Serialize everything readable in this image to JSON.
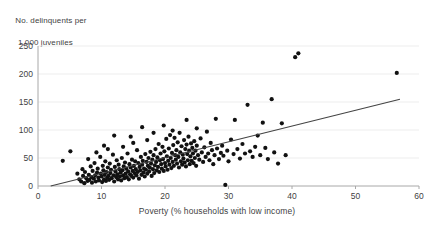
{
  "chart_data": {
    "type": "scatter",
    "title": "",
    "ylabel_line1": "No. delinquents per",
    "ylabel_line2": "1,000 juveniles",
    "xlabel": "Poverty (% households with low income)",
    "xlim": [
      0,
      60
    ],
    "ylim": [
      0,
      250
    ],
    "xticks": [
      0,
      10,
      20,
      30,
      40,
      50,
      60
    ],
    "yticks": [
      0,
      50,
      100,
      150,
      200,
      250
    ],
    "grid": "horizontal",
    "legend": "none",
    "point_color": "#111111",
    "point_radius": 2.1,
    "line_color": "#444444",
    "trendline": {
      "type": "linear",
      "x_start": 2.0,
      "y_start": 0,
      "x_end": 57.0,
      "y_end": 155
    },
    "points": [
      [
        3.9,
        45
      ],
      [
        5.1,
        62
      ],
      [
        6.2,
        22
      ],
      [
        6.5,
        12
      ],
      [
        6.8,
        8
      ],
      [
        7.0,
        30
      ],
      [
        7.1,
        18
      ],
      [
        7.3,
        5
      ],
      [
        7.4,
        25
      ],
      [
        7.6,
        14
      ],
      [
        7.8,
        9
      ],
      [
        7.9,
        48
      ],
      [
        8.0,
        20
      ],
      [
        8.1,
        11
      ],
      [
        8.3,
        35
      ],
      [
        8.4,
        16
      ],
      [
        8.5,
        6
      ],
      [
        8.6,
        27
      ],
      [
        8.8,
        13
      ],
      [
        8.9,
        41
      ],
      [
        9.0,
        19
      ],
      [
        9.1,
        8
      ],
      [
        9.3,
        24
      ],
      [
        9.4,
        31
      ],
      [
        9.5,
        15
      ],
      [
        9.6,
        10
      ],
      [
        9.8,
        52
      ],
      [
        9.9,
        22
      ],
      [
        10.0,
        17
      ],
      [
        10.1,
        7
      ],
      [
        10.2,
        36
      ],
      [
        10.3,
        28
      ],
      [
        10.4,
        12
      ],
      [
        10.5,
        20
      ],
      [
        10.6,
        44
      ],
      [
        10.7,
        9
      ],
      [
        10.8,
        25
      ],
      [
        10.9,
        15
      ],
      [
        11.0,
        33
      ],
      [
        11.1,
        18
      ],
      [
        11.2,
        11
      ],
      [
        11.3,
        40
      ],
      [
        11.4,
        23
      ],
      [
        11.5,
        29
      ],
      [
        11.6,
        14
      ],
      [
        11.8,
        56
      ],
      [
        11.9,
        19
      ],
      [
        12.0,
        8
      ],
      [
        12.1,
        34
      ],
      [
        12.2,
        26
      ],
      [
        12.3,
        16
      ],
      [
        12.4,
        46
      ],
      [
        12.5,
        21
      ],
      [
        12.6,
        12
      ],
      [
        12.7,
        38
      ],
      [
        12.8,
        30
      ],
      [
        12.9,
        17
      ],
      [
        13.0,
        24
      ],
      [
        13.1,
        10
      ],
      [
        13.2,
        50
      ],
      [
        13.3,
        28
      ],
      [
        13.4,
        19
      ],
      [
        13.5,
        35
      ],
      [
        13.6,
        14
      ],
      [
        13.7,
        42
      ],
      [
        13.8,
        22
      ],
      [
        13.9,
        31
      ],
      [
        14.0,
        16
      ],
      [
        14.1,
        58
      ],
      [
        14.2,
        26
      ],
      [
        14.3,
        12
      ],
      [
        14.4,
        39
      ],
      [
        14.5,
        21
      ],
      [
        14.6,
        33
      ],
      [
        14.7,
        18
      ],
      [
        14.8,
        47
      ],
      [
        14.9,
        27
      ],
      [
        15.0,
        15
      ],
      [
        15.1,
        36
      ],
      [
        15.2,
        23
      ],
      [
        15.3,
        44
      ],
      [
        15.4,
        30
      ],
      [
        15.5,
        19
      ],
      [
        15.6,
        64
      ],
      [
        15.7,
        25
      ],
      [
        15.8,
        41
      ],
      [
        15.9,
        13
      ],
      [
        16.0,
        34
      ],
      [
        16.1,
        28
      ],
      [
        16.2,
        52
      ],
      [
        16.3,
        20
      ],
      [
        16.4,
        38
      ],
      [
        16.5,
        45
      ],
      [
        16.6,
        24
      ],
      [
        16.7,
        31
      ],
      [
        16.8,
        17
      ],
      [
        16.9,
        57
      ],
      [
        17.0,
        29
      ],
      [
        17.1,
        43
      ],
      [
        17.2,
        22
      ],
      [
        17.3,
        36
      ],
      [
        17.4,
        50
      ],
      [
        17.5,
        26
      ],
      [
        17.6,
        33
      ],
      [
        17.7,
        61
      ],
      [
        17.8,
        40
      ],
      [
        17.9,
        18
      ],
      [
        18.0,
        47
      ],
      [
        18.1,
        30
      ],
      [
        18.2,
        55
      ],
      [
        18.3,
        23
      ],
      [
        18.4,
        37
      ],
      [
        18.5,
        66
      ],
      [
        18.6,
        43
      ],
      [
        18.7,
        28
      ],
      [
        18.8,
        51
      ],
      [
        18.9,
        34
      ],
      [
        19.0,
        75
      ],
      [
        19.1,
        25
      ],
      [
        19.2,
        46
      ],
      [
        19.3,
        58
      ],
      [
        19.4,
        39
      ],
      [
        19.5,
        31
      ],
      [
        19.6,
        70
      ],
      [
        19.7,
        48
      ],
      [
        19.8,
        27
      ],
      [
        19.9,
        62
      ],
      [
        20.0,
        41
      ],
      [
        20.1,
        35
      ],
      [
        20.2,
        84
      ],
      [
        20.3,
        53
      ],
      [
        20.4,
        29
      ],
      [
        20.5,
        45
      ],
      [
        20.6,
        67
      ],
      [
        20.7,
        38
      ],
      [
        20.8,
        91
      ],
      [
        20.9,
        50
      ],
      [
        21.0,
        32
      ],
      [
        21.1,
        59
      ],
      [
        21.2,
        43
      ],
      [
        21.3,
        73
      ],
      [
        21.4,
        36
      ],
      [
        21.5,
        86
      ],
      [
        21.6,
        55
      ],
      [
        21.7,
        47
      ],
      [
        21.8,
        64
      ],
      [
        21.9,
        40
      ],
      [
        22.0,
        78
      ],
      [
        22.1,
        52
      ],
      [
        22.2,
        33
      ],
      [
        22.3,
        95
      ],
      [
        22.4,
        60
      ],
      [
        22.5,
        44
      ],
      [
        22.6,
        71
      ],
      [
        22.7,
        38
      ],
      [
        22.8,
        56
      ],
      [
        22.9,
        49
      ],
      [
        23.0,
        82
      ],
      [
        23.1,
        42
      ],
      [
        23.2,
        66
      ],
      [
        23.3,
        35
      ],
      [
        23.4,
        74
      ],
      [
        23.5,
        57
      ],
      [
        23.6,
        46
      ],
      [
        23.7,
        88
      ],
      [
        23.8,
        63
      ],
      [
        23.9,
        39
      ],
      [
        24.0,
        53
      ],
      [
        24.1,
        76
      ],
      [
        24.2,
        45
      ],
      [
        24.3,
        68
      ],
      [
        24.4,
        58
      ],
      [
        24.5,
        41
      ],
      [
        24.6,
        80
      ],
      [
        24.7,
        50
      ],
      [
        24.8,
        63
      ],
      [
        24.9,
        36
      ],
      [
        25.0,
        72
      ],
      [
        25.2,
        55
      ],
      [
        25.4,
        47
      ],
      [
        25.6,
        85
      ],
      [
        25.8,
        60
      ],
      [
        26.0,
        43
      ],
      [
        26.2,
        69
      ],
      [
        26.4,
        52
      ],
      [
        26.6,
        97
      ],
      [
        26.8,
        58
      ],
      [
        27.0,
        46
      ],
      [
        27.2,
        77
      ],
      [
        27.4,
        64
      ],
      [
        27.6,
        39
      ],
      [
        27.8,
        55
      ],
      [
        28.0,
        120
      ],
      [
        28.2,
        67
      ],
      [
        28.5,
        48
      ],
      [
        28.8,
        59
      ],
      [
        29.0,
        72
      ],
      [
        29.2,
        54
      ],
      [
        29.5,
        2
      ],
      [
        29.8,
        63
      ],
      [
        30.0,
        44
      ],
      [
        30.4,
        83
      ],
      [
        30.8,
        57
      ],
      [
        31.0,
        118
      ],
      [
        31.4,
        66
      ],
      [
        31.8,
        49
      ],
      [
        32.2,
        75
      ],
      [
        32.6,
        58
      ],
      [
        33.0,
        145
      ],
      [
        33.4,
        62
      ],
      [
        33.8,
        52
      ],
      [
        34.2,
        70
      ],
      [
        34.6,
        90
      ],
      [
        35.0,
        55
      ],
      [
        35.4,
        113
      ],
      [
        35.8,
        68
      ],
      [
        36.2,
        48
      ],
      [
        36.8,
        155
      ],
      [
        37.2,
        60
      ],
      [
        37.8,
        40
      ],
      [
        38.4,
        112
      ],
      [
        39.0,
        55
      ],
      [
        40.5,
        230
      ],
      [
        41.0,
        237
      ],
      [
        12.0,
        90
      ],
      [
        14.6,
        88
      ],
      [
        16.4,
        105
      ],
      [
        18.2,
        95
      ],
      [
        19.8,
        108
      ],
      [
        21.2,
        99
      ],
      [
        23.4,
        118
      ],
      [
        25.0,
        103
      ],
      [
        10.4,
        72
      ],
      [
        9.2,
        60
      ],
      [
        11.0,
        66
      ],
      [
        13.4,
        70
      ],
      [
        15.0,
        77
      ],
      [
        17.2,
        82
      ],
      [
        56.5,
        202
      ]
    ]
  }
}
